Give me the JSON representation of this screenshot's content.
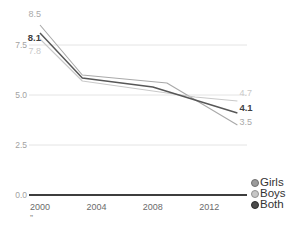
{
  "chart_data": {
    "type": "line",
    "title": "",
    "xlabel": "",
    "ylabel": "",
    "x_ticks": [
      {
        "label": "2000",
        "year": 2000
      },
      {
        "label": "2004",
        "year": 2004
      },
      {
        "label": "2008",
        "year": 2008
      },
      {
        "label": "2012",
        "year": 2012
      }
    ],
    "y_ticks": [
      {
        "label": "0.0",
        "value": 0.0
      },
      {
        "label": "2.5",
        "value": 2.5
      },
      {
        "label": "5.0",
        "value": 5.0
      },
      {
        "label": "7.5",
        "value": 7.5
      }
    ],
    "gridline_values": [
      2.5,
      5.0,
      7.5
    ],
    "xlim": [
      2000,
      2014
    ],
    "ylim": [
      0,
      9
    ],
    "grid": true,
    "legend_position": "right-bottom",
    "series": [
      {
        "name": "Girls",
        "color": "#a9a9a9",
        "legend_dot_color": "#9b9b9b",
        "legend_dot_border": "#6f6f6f",
        "bold_labels": false,
        "start_label": "8.5",
        "end_label": "3.5",
        "points": [
          [
            2000,
            8.5
          ],
          [
            2003,
            6.0
          ],
          [
            2009,
            5.6
          ],
          [
            2014,
            3.5
          ]
        ]
      },
      {
        "name": "Boys",
        "color": "#c9c9c9",
        "legend_dot_color": "#c6c6c6",
        "legend_dot_border": "#919191",
        "bold_labels": false,
        "start_label": "7.8",
        "end_label": "4.7",
        "points": [
          [
            2000,
            7.8
          ],
          [
            2003,
            5.7
          ],
          [
            2008,
            5.2
          ],
          [
            2011,
            4.9
          ],
          [
            2014,
            4.7
          ]
        ]
      },
      {
        "name": "Both",
        "color": "#575757",
        "legend_dot_color": "#4b4b4b",
        "legend_dot_border": "#2c2c2c",
        "bold_labels": true,
        "start_label": "8.1",
        "end_label": "4.1",
        "points": [
          [
            2000,
            8.1
          ],
          [
            2003,
            5.85
          ],
          [
            2008,
            5.4
          ],
          [
            2014,
            4.1
          ]
        ]
      }
    ],
    "colors": {
      "background": "#ffffff",
      "gridline": "#e4e4e4",
      "axis_line": "#3d3d3d",
      "y_tick_label": "#a2a2a2",
      "x_tick_label": "#6b6b6b",
      "bold_label": "#3f3f3f"
    },
    "caption_fragment": "”"
  }
}
